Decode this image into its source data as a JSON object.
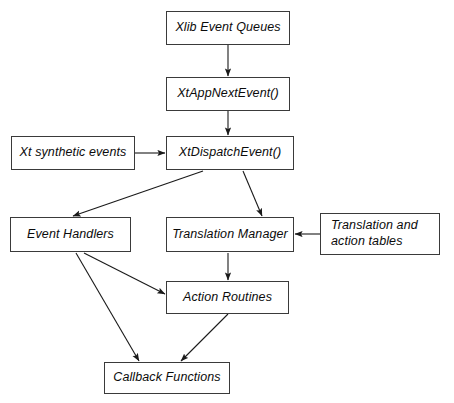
{
  "diagram": {
    "background_color": "#ffffff",
    "box_border_color": "#3a3a3a",
    "text_color": "#0b0b0b",
    "arrow_color": "#1a1a1a",
    "nodes": [
      {
        "id": "xlib_event_queues",
        "label": "Xlib Event Queues"
      },
      {
        "id": "xtappnextevent",
        "label": "XtAppNextEvent()"
      },
      {
        "id": "xt_synthetic_events",
        "label": "Xt synthetic events"
      },
      {
        "id": "xtdispatchevent",
        "label": "XtDispatchEvent()"
      },
      {
        "id": "event_handlers",
        "label": "Event Handlers"
      },
      {
        "id": "translation_manager",
        "label": "Translation Manager"
      },
      {
        "id": "translation_action_tables",
        "label": "Translation  and",
        "label_line2": "action tables"
      },
      {
        "id": "action_routines",
        "label": "Action Routines"
      },
      {
        "id": "callback_functions",
        "label": "Callback Functions"
      }
    ],
    "edges": [
      {
        "from": "xlib_event_queues",
        "to": "xtappnextevent"
      },
      {
        "from": "xtappnextevent",
        "to": "xtdispatchevent"
      },
      {
        "from": "xt_synthetic_events",
        "to": "xtdispatchevent"
      },
      {
        "from": "xtdispatchevent",
        "to": "event_handlers"
      },
      {
        "from": "xtdispatchevent",
        "to": "translation_manager"
      },
      {
        "from": "translation_action_tables",
        "to": "translation_manager"
      },
      {
        "from": "translation_manager",
        "to": "action_routines"
      },
      {
        "from": "event_handlers",
        "to": "action_routines"
      },
      {
        "from": "event_handlers",
        "to": "callback_functions"
      },
      {
        "from": "action_routines",
        "to": "callback_functions"
      }
    ]
  }
}
